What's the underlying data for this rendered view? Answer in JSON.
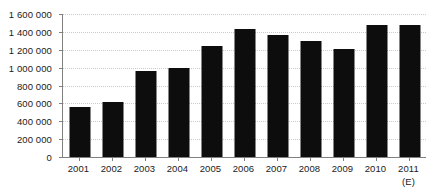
{
  "chart_data": {
    "type": "bar",
    "title": "",
    "subtitle": "",
    "xlabel": "",
    "ylabel": "",
    "categories": [
      "2001",
      "2002",
      "2003",
      "2004",
      "2005",
      "2006",
      "2007",
      "2008",
      "2009",
      "2010",
      "2011"
    ],
    "values": [
      560000,
      620000,
      960000,
      1000000,
      1240000,
      1430000,
      1370000,
      1300000,
      1210000,
      1480000,
      1480000
    ],
    "series": [
      {
        "name": "",
        "values": [
          560000,
          620000,
          960000,
          1000000,
          1240000,
          1430000,
          1370000,
          1300000,
          1210000,
          1480000,
          1480000
        ]
      }
    ],
    "ylim": [
      0,
      1600000
    ],
    "ytick_values": [
      0,
      200000,
      400000,
      600000,
      800000,
      1000000,
      1200000,
      1400000,
      1600000
    ],
    "ytick_labels": [
      "0",
      "200 000",
      "400 000",
      "600 000",
      "800 000",
      "1 000 000",
      "1 200 000",
      "1 400 000",
      "1 600 000"
    ],
    "grid": true,
    "grid_style": "dotted",
    "legend": false,
    "legend_position": "none",
    "bar_color": "#0d0d0d",
    "grid_color": "#c9c9cf",
    "axis_color": "#808080",
    "text_color": "#1a1a1a",
    "annotations": [
      {
        "text": "(E)",
        "attached_to_category": "2011",
        "position": "below-xtick",
        "meaning_hint": "estimate marker"
      }
    ]
  },
  "axis": {
    "x_sub_labels": [
      "",
      "",
      "",
      "",
      "",
      "",
      "",
      "",
      "",
      "",
      "(E)"
    ]
  }
}
